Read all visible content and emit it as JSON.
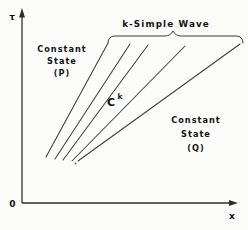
{
  "figure": {
    "colors": {
      "background": "#fcfcfb",
      "ink": "#3c3c3c",
      "text": "#141414"
    },
    "axes": {
      "tau_label": "τ",
      "origin_label": "0",
      "x_label": "x"
    },
    "annotations": {
      "wave_label": "k-Simple Wave",
      "ck_base": "C",
      "ck_superscript": "k",
      "region_p": {
        "line1": "Constant",
        "line2": "State",
        "line3": "(P)"
      },
      "region_q": {
        "line1": "Constant",
        "line2": "State",
        "line3": "(Q)"
      }
    },
    "fan_lines": [
      {
        "x1": 46,
        "y1": 157,
        "x2": 108,
        "y2": 43
      },
      {
        "x1": 55,
        "y1": 159,
        "x2": 130,
        "y2": 44
      },
      {
        "x1": 63,
        "y1": 160,
        "x2": 148,
        "y2": 45
      },
      {
        "x1": 72,
        "y1": 161,
        "x2": 185,
        "y2": 46
      },
      {
        "x1": 78,
        "y1": 161,
        "x2": 240,
        "y2": 44
      }
    ],
    "brace": {
      "x_start": 108,
      "x_end": 243,
      "y_top": 36,
      "y_end": 43,
      "peak_x": 173,
      "peak_y": 31
    }
  }
}
